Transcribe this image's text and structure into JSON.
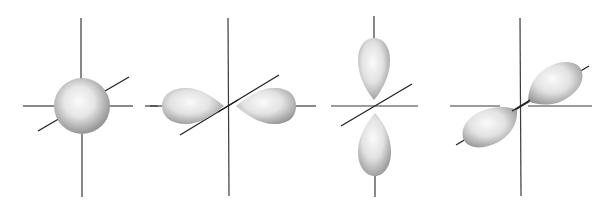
{
  "diagram": {
    "type": "atomic-orbitals",
    "panels": [
      {
        "id": "s-orbital",
        "shape": "sphere",
        "center": [
          81,
          106
        ]
      },
      {
        "id": "p-x-orbital",
        "shape": "two-lobes-horizontal",
        "center": [
          228,
          106
        ]
      },
      {
        "id": "p-z-orbital",
        "shape": "two-lobes-vertical",
        "center": [
          374,
          106
        ]
      },
      {
        "id": "p-y-orbital",
        "shape": "two-lobes-diagonal",
        "center": [
          520,
          106
        ]
      }
    ],
    "colors": {
      "background": "#ffffff",
      "axis": "#333333",
      "lobe_light": "#f4f4f4",
      "lobe_dark": "#9a9a9a"
    }
  }
}
